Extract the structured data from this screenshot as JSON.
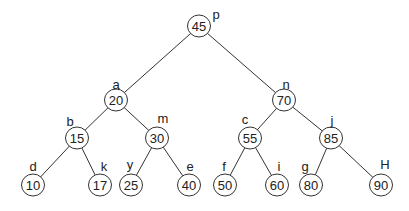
{
  "diagram": {
    "type": "binary-search-tree",
    "colors": {
      "stroke": "#333333",
      "text": "#222222",
      "background": "#ffffff"
    },
    "nodes": [
      {
        "id": "p",
        "value": "45",
        "label": "p"
      },
      {
        "id": "a",
        "value": "20",
        "label": "a"
      },
      {
        "id": "n",
        "value": "70",
        "label": "n"
      },
      {
        "id": "b",
        "value": "15",
        "label": "b"
      },
      {
        "id": "m",
        "value": "30",
        "label": "m"
      },
      {
        "id": "c",
        "value": "55",
        "label": "c"
      },
      {
        "id": "j",
        "value": "85",
        "label": "j"
      },
      {
        "id": "d",
        "value": "10",
        "label": "d"
      },
      {
        "id": "k",
        "value": "17",
        "label": "k"
      },
      {
        "id": "y",
        "value": "25",
        "label": "y"
      },
      {
        "id": "e",
        "value": "40",
        "label": "e"
      },
      {
        "id": "f",
        "value": "50",
        "label": "f"
      },
      {
        "id": "i",
        "value": "60",
        "label": "i"
      },
      {
        "id": "g",
        "value": "80",
        "label": "g"
      },
      {
        "id": "H",
        "value": "90",
        "label": "H"
      }
    ],
    "edges": [
      {
        "from": "p",
        "to": "a"
      },
      {
        "from": "p",
        "to": "n"
      },
      {
        "from": "a",
        "to": "b"
      },
      {
        "from": "a",
        "to": "m"
      },
      {
        "from": "n",
        "to": "c"
      },
      {
        "from": "n",
        "to": "j"
      },
      {
        "from": "b",
        "to": "d"
      },
      {
        "from": "b",
        "to": "k"
      },
      {
        "from": "m",
        "to": "y"
      },
      {
        "from": "m",
        "to": "e"
      },
      {
        "from": "c",
        "to": "f"
      },
      {
        "from": "c",
        "to": "i"
      },
      {
        "from": "j",
        "to": "g"
      },
      {
        "from": "j",
        "to": "H"
      }
    ]
  }
}
